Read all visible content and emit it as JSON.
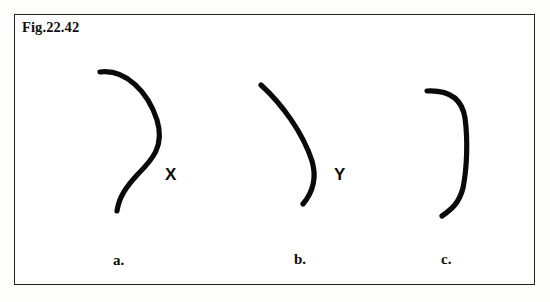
{
  "figure": {
    "caption_label": "Fig.22.42",
    "border_color": "#222020",
    "background_color": "#ffffff",
    "page_background_color": "#fdfdfb",
    "ink_color": "#111010"
  },
  "panels": [
    {
      "id": "panel-a",
      "label": "a.",
      "marker": "X",
      "shape_description": "S-shaped curve"
    },
    {
      "id": "panel-b",
      "label": "b.",
      "marker": "Y",
      "shape_description": "single smooth arc bulging right"
    },
    {
      "id": "panel-c",
      "label": "c.",
      "marker": "",
      "shape_description": "flat-sided curve with bends at top and bottom"
    }
  ],
  "markers": {
    "x_label": "X",
    "y_label": "Y"
  }
}
